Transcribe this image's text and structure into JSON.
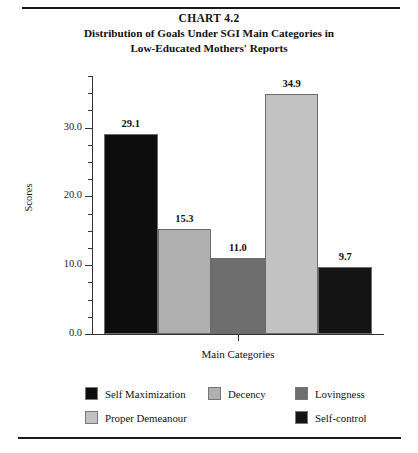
{
  "figure": {
    "title_line1": "CHART 4.2",
    "title_line2": "Distribution of Goals Under SGI Main Categories in",
    "title_line3": "Low-Educated Mothers' Reports"
  },
  "chart_data": {
    "type": "bar",
    "title": "Distribution of Goals Under SGI Main Categories in Low-Educated Mothers' Reports",
    "categories": [
      "Self Maximization",
      "Decency",
      "Lovingness",
      "Proper Demeanour",
      "Self-control"
    ],
    "values": [
      29.1,
      15.3,
      11.0,
      34.9,
      9.7
    ],
    "value_labels": [
      "29.1",
      "15.3",
      "11.0",
      "34.9",
      "9.7"
    ],
    "colors": [
      "#0d0d0d",
      "#b0b0b0",
      "#6e6e6e",
      "#c2c2c2",
      "#141414"
    ],
    "xlabel": "Main Categories",
    "ylabel": "Scores",
    "ylim": [
      0.0,
      37.5
    ],
    "ytick_major": [
      0.0,
      10.0,
      20.0,
      30.0
    ],
    "ytick_major_labels": [
      "0.0",
      "10.0",
      "20.0",
      "30.0"
    ],
    "ytick_minor": [
      2.5,
      5.0,
      7.5,
      12.5,
      15.0,
      17.5,
      22.5,
      25.0,
      27.5,
      32.5,
      35.0,
      37.5
    ],
    "grid": false,
    "legend_position": "bottom"
  },
  "legend": {
    "items": [
      {
        "label": "Self Maximization",
        "color": "#0d0d0d"
      },
      {
        "label": "Decency",
        "color": "#b0b0b0"
      },
      {
        "label": "Lovingness",
        "color": "#6e6e6e"
      },
      {
        "label": "Proper Demeanour",
        "color": "#c2c2c2"
      },
      {
        "label": "Self-control",
        "color": "#141414"
      }
    ]
  }
}
